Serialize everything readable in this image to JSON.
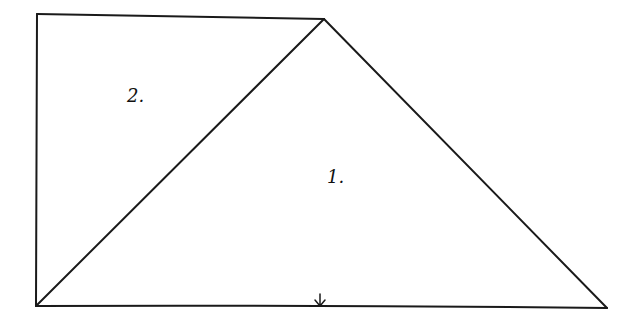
{
  "diagram": {
    "stroke_color": "#1a1a1a",
    "background": "#ffffff",
    "regions": [
      {
        "id": "region-1",
        "label": "1.",
        "x": 327,
        "y": 168
      },
      {
        "id": "region-2",
        "label": "2.",
        "x": 127,
        "y": 87
      }
    ],
    "vertices": {
      "top_left": [
        37,
        14
      ],
      "apex": [
        324,
        19
      ],
      "bottom_left": [
        36,
        306
      ],
      "bottom_right": [
        607,
        308
      ]
    },
    "marker": {
      "type": "down-arrow",
      "x": 320,
      "y": 296
    }
  }
}
